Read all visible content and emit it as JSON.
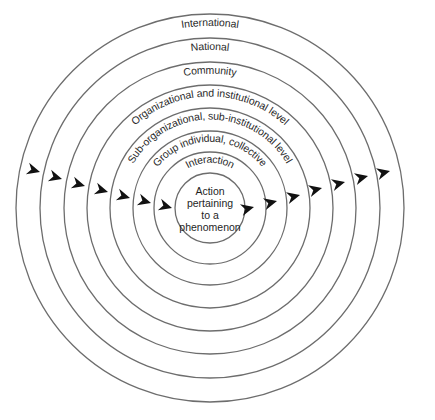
{
  "diagram": {
    "type": "concentric-circles",
    "center": {
      "x": 210,
      "y": 208
    },
    "core": {
      "lines": [
        "Action",
        "pertaining",
        "to a",
        "phenomenon"
      ]
    },
    "rings": [
      {
        "radius": 35,
        "label": "",
        "role": "core"
      },
      {
        "radius": 56,
        "label": "Interaction"
      },
      {
        "radius": 77,
        "label": "Group individual, collective"
      },
      {
        "radius": 100,
        "label": "Sub-organizational, sub-institutional level"
      },
      {
        "radius": 123,
        "label": "Organizational and institutional level"
      },
      {
        "radius": 146,
        "label": "Community"
      },
      {
        "radius": 170,
        "label": "National"
      },
      {
        "radius": 194,
        "label": "International"
      }
    ],
    "arrows": {
      "direction": "left-to-right across rings",
      "left": [
        {
          "x": 40,
          "y": 172
        },
        {
          "x": 62,
          "y": 179
        },
        {
          "x": 85,
          "y": 186
        },
        {
          "x": 108,
          "y": 192
        },
        {
          "x": 130,
          "y": 198
        },
        {
          "x": 151,
          "y": 203
        },
        {
          "x": 172,
          "y": 208
        }
      ],
      "right": [
        {
          "x": 254,
          "y": 207
        },
        {
          "x": 277,
          "y": 201
        },
        {
          "x": 300,
          "y": 195
        },
        {
          "x": 322,
          "y": 188
        },
        {
          "x": 345,
          "y": 182
        },
        {
          "x": 368,
          "y": 176
        },
        {
          "x": 390,
          "y": 171
        }
      ]
    },
    "colors": {
      "ring_stroke": "#6d6d6d",
      "arrow_fill": "#111111",
      "text": "#2a2a2a",
      "background": "#ffffff"
    }
  }
}
